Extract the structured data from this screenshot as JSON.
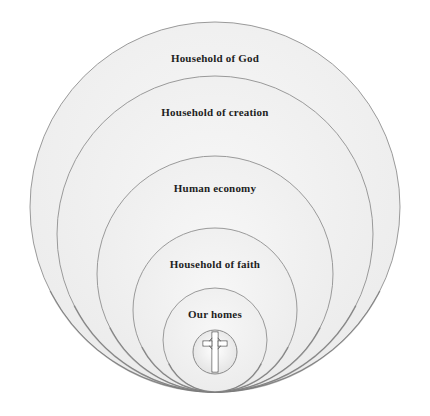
{
  "diagram": {
    "type": "nested-circles",
    "circles": [
      {
        "id": "household-of-god",
        "label": "Household of God"
      },
      {
        "id": "household-of-creation",
        "label": "Household of creation"
      },
      {
        "id": "human-economy",
        "label": "Human economy"
      },
      {
        "id": "household-of-faith",
        "label": "Household of faith"
      },
      {
        "id": "our-homes",
        "label": "Our homes"
      }
    ],
    "center_icon": "celtic-cross-icon",
    "colors": {
      "ring_fill": "#f2f2f2",
      "ring_stroke": "#9a9a9a",
      "text": "#1e1e1e"
    }
  }
}
